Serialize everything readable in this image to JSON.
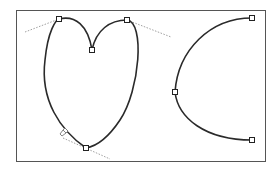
{
  "canvas": {
    "width": 277,
    "height": 170,
    "background": "#ffffff",
    "frame": {
      "x": 16,
      "y": 10,
      "width": 249,
      "height": 151,
      "stroke": "#555555"
    }
  },
  "colors": {
    "path": "#2a2a2a",
    "handle_line": "#888888",
    "anchor_fill": "#ffffff",
    "anchor_stroke": "#222222"
  },
  "shapes": [
    {
      "name": "heart-path",
      "d": "M 86 148 C 60 130, 40 100, 45 60 C 48 30, 56 20, 59 19 C 75 15, 88 25, 92 50 C 96 30, 110 20, 127 20 C 145 22, 140 90, 120 120 C 110 135, 98 146, 86 148 Z",
      "anchors": [
        {
          "x": 59,
          "y": 19
        },
        {
          "x": 127,
          "y": 20
        },
        {
          "x": 92,
          "y": 50
        },
        {
          "x": 86,
          "y": 148
        }
      ],
      "handles": [
        {
          "x1": 25,
          "y1": 32,
          "x2": 59,
          "y2": 19
        },
        {
          "x1": 127,
          "y1": 20,
          "x2": 171,
          "y2": 37
        },
        {
          "x1": 63,
          "y1": 138,
          "x2": 110,
          "y2": 159
        }
      ]
    },
    {
      "name": "arc-path",
      "d": "M 252 18 C 210 18, 178 50, 175 92 C 178 118, 205 140, 252 140",
      "anchors": [
        {
          "x": 252,
          "y": 18
        },
        {
          "x": 175,
          "y": 92
        },
        {
          "x": 252,
          "y": 140
        }
      ],
      "handles": []
    }
  ],
  "cursor": {
    "x": 60,
    "y": 134,
    "icon": "pen-cursor-icon"
  }
}
